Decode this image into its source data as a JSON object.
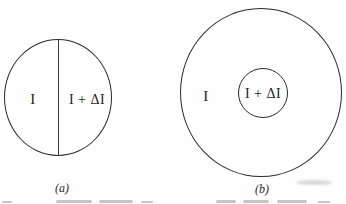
{
  "figure": {
    "panels": [
      {
        "id": "a",
        "caption": "(a)",
        "left_label": "I",
        "right_label": "I + ΔI"
      },
      {
        "id": "b",
        "caption": "(b)",
        "outer_label": "I",
        "inner_label": "I + ΔI"
      }
    ],
    "colors": {
      "stroke": "#2a2a2a",
      "background": "#fefefe"
    }
  }
}
